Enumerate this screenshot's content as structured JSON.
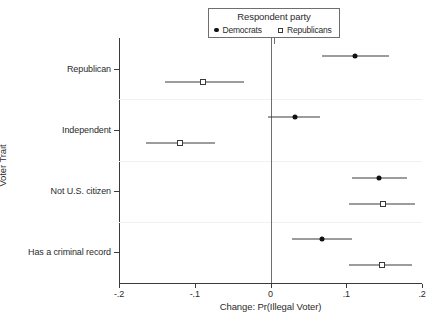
{
  "chart_data": {
    "type": "scatter",
    "title": "",
    "xlabel": "Change: Pr(Illegal Voter)",
    "ylabel": "Voter Trait",
    "xlim": [
      -0.2,
      0.2
    ],
    "xticks": [
      -0.2,
      -0.1,
      0,
      0.1,
      0.2
    ],
    "xtick_labels": [
      "-.2",
      "-.1",
      "0",
      ".1",
      ".2"
    ],
    "categories": [
      "Republican",
      "Independent",
      "Not U.S. citizen",
      "Has a criminal record"
    ],
    "grid": "faint horizontal category separators",
    "legend": {
      "title": "Respondent party",
      "position": "top-center",
      "entries": [
        {
          "label": "Democrats",
          "marker": "filled-circle"
        },
        {
          "label": "Republicans",
          "marker": "open-square"
        }
      ]
    },
    "series": [
      {
        "name": "Democrats",
        "marker": "filled-circle",
        "points": [
          {
            "category": "Republican",
            "estimate": 0.111,
            "ci_low": 0.068,
            "ci_high": 0.156
          },
          {
            "category": "Independent",
            "estimate": 0.033,
            "ci_low": -0.003,
            "ci_high": 0.066
          },
          {
            "category": "Not U.S. citizen",
            "estimate": 0.143,
            "ci_low": 0.107,
            "ci_high": 0.18
          },
          {
            "category": "Has a criminal record",
            "estimate": 0.068,
            "ci_low": 0.028,
            "ci_high": 0.107
          }
        ]
      },
      {
        "name": "Republicans",
        "marker": "open-square",
        "points": [
          {
            "category": "Republican",
            "estimate": -0.089,
            "ci_low": -0.139,
            "ci_high": -0.035
          },
          {
            "category": "Independent",
            "estimate": -0.12,
            "ci_low": -0.165,
            "ci_high": -0.073
          },
          {
            "category": "Not U.S. citizen",
            "estimate": 0.148,
            "ci_low": 0.103,
            "ci_high": 0.191
          },
          {
            "category": "Has a criminal record",
            "estimate": 0.147,
            "ci_low": 0.104,
            "ci_high": 0.187
          }
        ]
      }
    ]
  }
}
